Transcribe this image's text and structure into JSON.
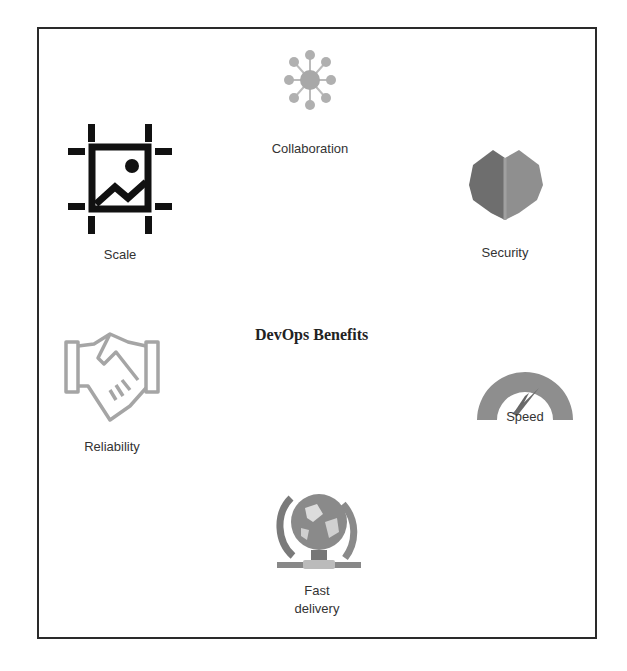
{
  "diagram": {
    "title": "DevOps Benefits",
    "benefits": [
      {
        "id": "collaboration",
        "label": "Collaboration",
        "icon": "network-nodes-icon"
      },
      {
        "id": "scale",
        "label": "Scale",
        "icon": "image-scale-icon"
      },
      {
        "id": "security",
        "label": "Security",
        "icon": "shield-icon"
      },
      {
        "id": "reliability",
        "label": "Reliability",
        "icon": "handshake-icon"
      },
      {
        "id": "speed",
        "label": "Speed",
        "icon": "speedometer-icon"
      },
      {
        "id": "fast_delivery",
        "label": "Fast\ndelivery",
        "label_line1": "Fast",
        "label_line2": "delivery",
        "icon": "globe-icon"
      }
    ],
    "colors": {
      "border": "#2a2a2a",
      "icon_gray": "#9a9a9a",
      "text": "#333333"
    }
  }
}
